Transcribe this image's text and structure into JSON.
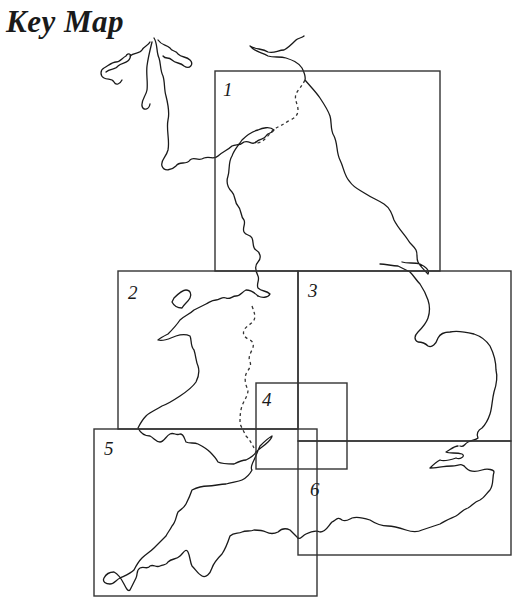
{
  "title": "Key Map",
  "colors": {
    "line": "#1a1a1a",
    "box": "#333333",
    "background": "#ffffff"
  },
  "sections": [
    {
      "id": 1,
      "label": "1",
      "x": 215,
      "y": 71,
      "w": 225,
      "h": 200
    },
    {
      "id": 2,
      "label": "2",
      "x": 118,
      "y": 271,
      "w": 180,
      "h": 158
    },
    {
      "id": 3,
      "label": "3",
      "x": 298,
      "y": 271,
      "w": 213,
      "h": 170
    },
    {
      "id": 4,
      "label": "4",
      "x": 256,
      "y": 383,
      "w": 91,
      "h": 86
    },
    {
      "id": 5,
      "label": "5",
      "x": 94,
      "y": 429,
      "w": 223,
      "h": 167
    },
    {
      "id": 6,
      "label": "6",
      "x": 298,
      "y": 441,
      "w": 213,
      "h": 114
    }
  ],
  "legend": {
    "dashed_line": "national-border"
  }
}
